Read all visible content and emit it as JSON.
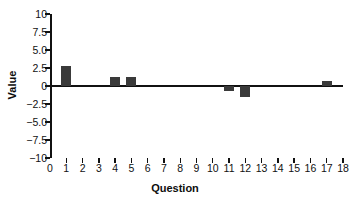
{
  "chart_data": {
    "type": "bar",
    "title": "",
    "subtitle": "",
    "xlabel": "Question",
    "ylabel": "Value",
    "categories": [
      1,
      2,
      3,
      4,
      5,
      6,
      7,
      8,
      9,
      10,
      11,
      12,
      13,
      14,
      15,
      16,
      17
    ],
    "values": [
      2.8,
      0,
      0,
      1.3,
      1.3,
      0,
      0,
      0,
      0,
      0,
      -0.7,
      -1.5,
      0,
      0,
      0,
      0,
      0.7
    ],
    "series": [
      {
        "name": "Value",
        "values": [
          2.8,
          0,
          0,
          1.3,
          1.3,
          0,
          0,
          0,
          0,
          0,
          -0.7,
          -1.5,
          0,
          0,
          0,
          0,
          0.7
        ]
      }
    ],
    "xlim": [
      0,
      18
    ],
    "ylim": [
      -10,
      10
    ],
    "ytick_labels": [
      "10",
      "7.5",
      "5.0",
      "2.5",
      "0",
      "−2.5",
      "−5.0",
      "−7.5",
      "−10"
    ],
    "ytick_values": [
      10,
      7.5,
      5,
      2.5,
      0,
      -2.5,
      -5,
      -7.5,
      -10
    ],
    "xtick_labels": [
      "0",
      "1",
      "2",
      "3",
      "4",
      "5",
      "6",
      "7",
      "8",
      "9",
      "10",
      "11",
      "12",
      "13",
      "14",
      "15",
      "16",
      "17",
      "18"
    ],
    "xtick_values": [
      0,
      1,
      2,
      3,
      4,
      5,
      6,
      7,
      8,
      9,
      10,
      11,
      12,
      13,
      14,
      15,
      16,
      17,
      18
    ],
    "grid": false,
    "legend": false,
    "legend_position": "none",
    "bar_color": "#3a3a3a",
    "axis_color": "#111111",
    "background_color": "#ffffff",
    "annotations": []
  }
}
